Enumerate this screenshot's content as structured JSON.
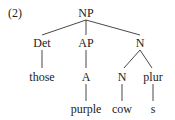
{
  "example_number": "(2)",
  "tree": {
    "root": "NP",
    "level1": {
      "det": "Det",
      "ap": "AP",
      "n": "N"
    },
    "level2": {
      "those": "those",
      "a": "A",
      "n": "N",
      "plur": "plur"
    },
    "level3": {
      "purple": "purple",
      "cow": "cow",
      "s": "s"
    }
  }
}
